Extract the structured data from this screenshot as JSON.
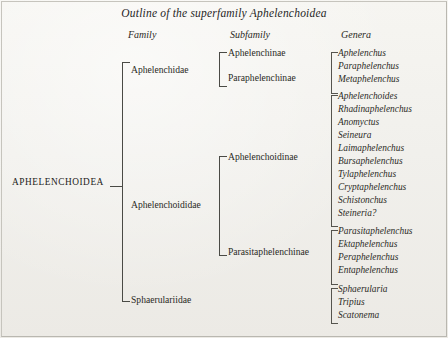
{
  "title": "Outline of the superfamily Aphelenchoidea",
  "headers": {
    "family": "Family",
    "subfamily": "Subfamily",
    "genera": "Genera"
  },
  "superfamily": "APHELENCHOIDEA",
  "families": [
    {
      "name": "Aphelenchidae"
    },
    {
      "name": "Aphelenchoididae"
    },
    {
      "name": "Sphaerulariidae"
    }
  ],
  "subfamilies": [
    {
      "name": "Aphelenchinae"
    },
    {
      "name": "Paraphelenchinae"
    },
    {
      "name": "Aphelenchoidinae"
    },
    {
      "name": "Parasitaphelenchinae"
    }
  ],
  "genera": [
    {
      "name": "Aphelenchus"
    },
    {
      "name": "Paraphelenchus"
    },
    {
      "name": "Metaphelenchus"
    },
    {
      "name": "Aphelenchoides"
    },
    {
      "name": "Rhadinaphelenchus"
    },
    {
      "name": "Anomyctus"
    },
    {
      "name": "Seineura"
    },
    {
      "name": "Laimaphelenchus"
    },
    {
      "name": "Bursaphelenchus"
    },
    {
      "name": "Tylaphelenchus"
    },
    {
      "name": "Cryptaphelenchus"
    },
    {
      "name": "Schistonchus"
    },
    {
      "name": "Steineria?"
    },
    {
      "name": "Parasitaphelenchus"
    },
    {
      "name": "Ektaphelenchus"
    },
    {
      "name": "Peraphelenchus"
    },
    {
      "name": "Entaphelenchus"
    },
    {
      "name": "Sphaerularia"
    },
    {
      "name": "Tripius"
    },
    {
      "name": "Scatonema"
    }
  ]
}
